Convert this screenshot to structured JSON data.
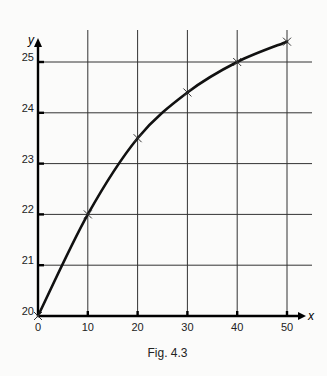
{
  "figure": {
    "caption": "Fig. 4.3"
  },
  "chart_data": {
    "type": "line",
    "title": "",
    "caption": "Fig. 4.3",
    "xlabel": "x",
    "ylabel": "y",
    "x": [
      0,
      10,
      20,
      30,
      40,
      50
    ],
    "series": [
      {
        "name": "y",
        "values": [
          20.0,
          22.0,
          23.5,
          24.4,
          25.0,
          25.4
        ],
        "marker": "x",
        "smooth": true
      }
    ],
    "xlim": [
      0,
      50
    ],
    "ylim": [
      20,
      25.5
    ],
    "x_ticks": [
      "0",
      "10",
      "20",
      "30",
      "40",
      "50"
    ],
    "y_ticks": [
      "20",
      "21",
      "22",
      "23",
      "24",
      "25"
    ],
    "grid": true,
    "legend": "none",
    "colors": {
      "line": "#111111",
      "grid": "#333333",
      "axis": "#000000"
    }
  }
}
